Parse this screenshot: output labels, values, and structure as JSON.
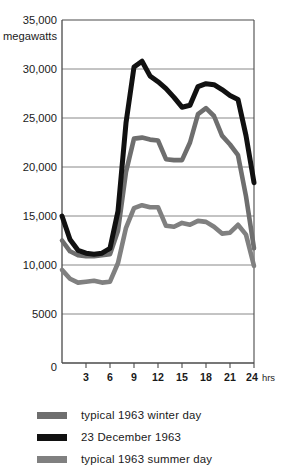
{
  "chart_data": {
    "type": "line",
    "title": "",
    "subtitle": "",
    "xlabel": "hrs",
    "ylabel": "megawatts",
    "unit_label": "megawatts",
    "x_unit_suffix": "hrs",
    "xlim": [
      0,
      24
    ],
    "ylim": [
      0,
      35000
    ],
    "grid": true,
    "grid_axis": "y",
    "legend_position": "below",
    "x_ticks": [
      3,
      6,
      9,
      12,
      15,
      18,
      21,
      24
    ],
    "x_tick_labels": [
      "3",
      "6",
      "9",
      "12",
      "15",
      "18",
      "21",
      "24"
    ],
    "y_ticks": [
      0,
      5000,
      10000,
      15000,
      20000,
      25000,
      30000,
      35000
    ],
    "y_tick_labels": [
      "0",
      "5000",
      "10,000",
      "15,000",
      "20,000",
      "25,000",
      "30,000",
      "35,000"
    ],
    "x": [
      0,
      1,
      2,
      3,
      4,
      5,
      6,
      7,
      8,
      9,
      10,
      11,
      12,
      13,
      14,
      15,
      16,
      17,
      18,
      19,
      20,
      21,
      22,
      23,
      24
    ],
    "series": [
      {
        "name": "typical 1963 winter day",
        "color": "#6e6e6e",
        "values": [
          12500,
          11400,
          11000,
          10900,
          10900,
          11000,
          11100,
          13500,
          19500,
          22900,
          23000,
          22800,
          22700,
          20800,
          20700,
          20700,
          22500,
          25400,
          26000,
          25200,
          23200,
          22300,
          21200,
          17000,
          11700
        ]
      },
      {
        "name": "23 December 1963",
        "color": "#111111",
        "values": [
          15000,
          12600,
          11500,
          11200,
          11100,
          11200,
          11700,
          15500,
          24500,
          30200,
          30800,
          29300,
          28700,
          28000,
          27100,
          26100,
          26300,
          28200,
          28500,
          28400,
          27900,
          27300,
          26900,
          23200,
          18400
        ]
      },
      {
        "name": "typical 1963 summer day",
        "color": "#808080",
        "values": [
          9500,
          8600,
          8200,
          8300,
          8400,
          8200,
          8300,
          10200,
          13800,
          15800,
          16100,
          15900,
          15900,
          14000,
          13900,
          14300,
          14100,
          14500,
          14400,
          13900,
          13200,
          13300,
          14100,
          13100,
          9900
        ]
      }
    ],
    "series_order_draw": [
      "typical 1963 winter day",
      "typical 1963 summer day",
      "23 December 1963"
    ]
  },
  "legend": {
    "items": [
      {
        "label": "typical 1963 winter day",
        "color": "#6e6e6e",
        "swatch_name": "legend-swatch-winter"
      },
      {
        "label": "23 December 1963",
        "color": "#111111",
        "swatch_name": "legend-swatch-december"
      },
      {
        "label": "typical 1963 summer day",
        "color": "#808080",
        "swatch_name": "legend-swatch-summer"
      }
    ]
  },
  "axis": {
    "unit_label": "megawatts",
    "hrs_label": "hrs"
  },
  "colors": {
    "axis_line": "#4a4a4a",
    "grid_line": "#7a7a7a",
    "text": "#1a1a1a",
    "background": "#ffffff"
  }
}
